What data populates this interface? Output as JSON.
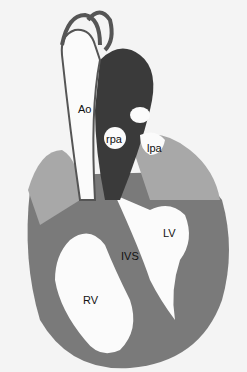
{
  "figure": {
    "colors": {
      "background": "#f4f4f4",
      "tissue_dark": "#3a3a3a",
      "tissue_mid": "#7a7a7a",
      "tissue_light": "#a8a8a8",
      "lumen": "#fbfbfb"
    },
    "labels": [
      {
        "id": "ao",
        "text": "Ao",
        "x": 78,
        "y": 104
      },
      {
        "id": "rpa",
        "text": "rpa",
        "x": 106,
        "y": 134
      },
      {
        "id": "lpa",
        "text": "lpa",
        "x": 147,
        "y": 143
      },
      {
        "id": "lv",
        "text": "LV",
        "x": 163,
        "y": 228
      },
      {
        "id": "ivs",
        "text": "IVS",
        "x": 121,
        "y": 251
      },
      {
        "id": "rv",
        "text": "RV",
        "x": 83,
        "y": 295
      }
    ]
  }
}
